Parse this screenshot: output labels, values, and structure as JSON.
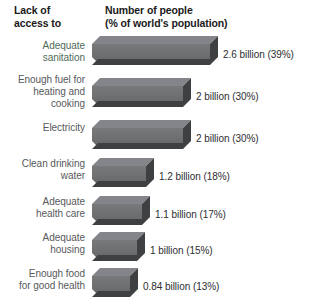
{
  "header": {
    "left_line1": "Lack of",
    "left_line2": "access to",
    "right_line1": "Number of people",
    "right_line2": "(% of world's population)"
  },
  "chart_data": {
    "type": "bar",
    "orientation": "horizontal",
    "title": "",
    "xlabel": "Number of people (% of world's population)",
    "ylabel": "Lack of access to",
    "grid": false,
    "legend": "none",
    "xlim": [
      0,
      2.6
    ],
    "categories": [
      "Adequate sanitation",
      "Enough fuel for heating and cooking",
      "Electricity",
      "Clean drinking water",
      "Adequate health care",
      "Adequate housing",
      "Enough food for good health"
    ],
    "values": [
      2.6,
      2,
      2,
      1.2,
      1.1,
      1,
      0.84
    ],
    "percents": [
      39,
      30,
      30,
      18,
      17,
      15,
      13
    ],
    "value_labels": [
      "2.6 billion (39%)",
      "2 billion (30%)",
      "2 billion (30%)",
      "1.2 billion (18%)",
      "1.1 billion (17%)",
      "1 billion (15%)",
      "0.84 billion (13%)"
    ],
    "units": "billion people"
  },
  "rows": [
    {
      "label_lines": [
        "Adequate",
        "sanitation"
      ],
      "value_label": "2.6 billion (39%)",
      "tinted": true
    },
    {
      "label_lines": [
        "Enough fuel for",
        "heating and",
        "cooking"
      ],
      "value_label": "2 billion (30%)",
      "tinted": false
    },
    {
      "label_lines": [
        "Electricity"
      ],
      "value_label": "2 billion (30%)",
      "tinted": false
    },
    {
      "label_lines": [
        "Clean drinking",
        "water"
      ],
      "value_label": "1.2 billion (18%)",
      "tinted": false
    },
    {
      "label_lines": [
        "Adequate",
        "health care"
      ],
      "value_label": "1.1 billion (17%)",
      "tinted": false
    },
    {
      "label_lines": [
        "Adequate",
        "housing"
      ],
      "value_label": "1 billion (15%)",
      "tinted": false
    },
    {
      "label_lines": [
        "Enough food",
        "for good health"
      ],
      "value_label": "0.84 billion (13%)",
      "tinted": false
    }
  ],
  "colors": {
    "bar_front": "#6d6f71",
    "bar_top": "#8a8c8e",
    "bar_side": "#3d3f41",
    "label_text": "#58595b",
    "value_text": "#2c2d2f",
    "header_text": "#1a1a1a",
    "tinted_label": "#4f6b57",
    "background": "#ffffff"
  }
}
